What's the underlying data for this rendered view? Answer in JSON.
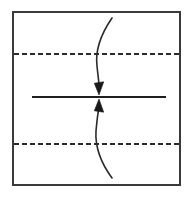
{
  "figure": {
    "canvas": {
      "width": 188,
      "height": 198,
      "background": "#ffffff"
    },
    "colors": {
      "stroke": "#2b2b2b",
      "frame": "#3a3a3a",
      "dashed": "#2b2b2b",
      "solid": "#1f1f1f",
      "arrow_fill": "#1a1a1a",
      "background": "#ffffff"
    },
    "frame": {
      "name": "panel-border",
      "x": 13,
      "y": 12,
      "width": 167,
      "height": 173,
      "stroke_width": 2
    },
    "dashed_lines": [
      {
        "name": "upper-dashed-line",
        "label": "upper boundary",
        "y": 54,
        "x1": 14,
        "x2": 180,
        "dash": "5 3",
        "stroke_width": 1.8
      },
      {
        "name": "lower-dashed-line",
        "label": "lower boundary",
        "y": 144,
        "x1": 14,
        "x2": 180,
        "dash": "5 3",
        "stroke_width": 1.8
      }
    ],
    "solid_line": {
      "name": "center-solid-line",
      "label": "central interface",
      "y": 97,
      "x1": 32,
      "x2": 166,
      "stroke_width": 1.8
    },
    "arrows": [
      {
        "name": "upper-converging-arrow",
        "label": "downward curved arrow",
        "direction": "down",
        "path": "M 112 18 C 101 34, 95 50, 97 66 C 98 76, 99 82, 99 86",
        "tip": {
          "x": 99,
          "y": 95
        },
        "stroke_width": 1.6
      },
      {
        "name": "lower-converging-arrow",
        "label": "upward curved arrow",
        "direction": "up",
        "path": "M 112 178 C 101 163, 95 147, 96 131 C 97 120, 98 112, 99 108",
        "tip": {
          "x": 99,
          "y": 99
        },
        "stroke_width": 1.6
      }
    ]
  }
}
